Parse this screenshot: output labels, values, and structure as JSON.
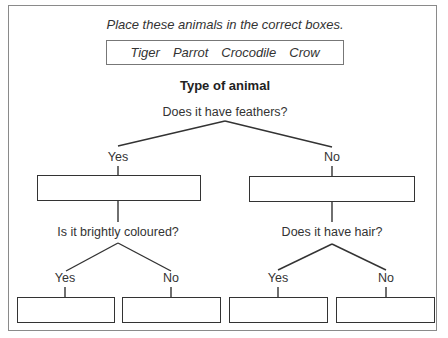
{
  "instruction": "Place these animals in the correct boxes.",
  "animals": [
    "Tiger",
    "Parrot",
    "Crocodile",
    "Crow"
  ],
  "title": "Type of animal",
  "tree": {
    "root_question": "Does it have feathers?",
    "yes_label": "Yes",
    "no_label": "No",
    "yes_branch": {
      "question": "Is it brightly coloured?",
      "yes_label": "Yes",
      "no_label": "No"
    },
    "no_branch": {
      "question": "Does it have hair?",
      "yes_label": "Yes",
      "no_label": "No"
    }
  },
  "colors": {
    "frame": "#8a8a8a",
    "lines": "#333333",
    "text": "#333333"
  }
}
